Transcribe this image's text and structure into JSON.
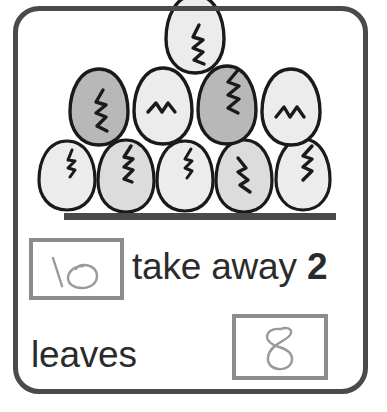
{
  "worksheet": {
    "type": "subtraction-picture-problem",
    "frame_color": "#4a4a4a",
    "background_color": "#ffffff"
  },
  "illustration": {
    "subject": "cracked-eggs",
    "total_eggs": 10,
    "outline_color": "#1a1a1a",
    "light_fill": "#ececec",
    "mid_fill": "#dcdcdc",
    "dark_fill": "#b8b8b8",
    "rows": [
      {
        "row": "top",
        "count": 1,
        "eggs": [
          {
            "shade": "light"
          }
        ]
      },
      {
        "row": "middle",
        "count": 4,
        "eggs": [
          {
            "shade": "dark"
          },
          {
            "shade": "light"
          },
          {
            "shade": "dark"
          },
          {
            "shade": "light"
          }
        ]
      },
      {
        "row": "bottom",
        "count": 5,
        "eggs": [
          {
            "shade": "light"
          },
          {
            "shade": "mid"
          },
          {
            "shade": "light"
          },
          {
            "shade": "mid"
          },
          {
            "shade": "light"
          }
        ]
      }
    ]
  },
  "separator": {
    "color": "#4a4a4a"
  },
  "problem": {
    "first_box": {
      "label": "minuend-answer-box",
      "handwritten_value": "10",
      "border_color": "#8c8c8c",
      "ink_color": "#9a9a9a"
    },
    "operator_text": "take away ",
    "subtrahend": "2",
    "result_text": "leaves",
    "second_box": {
      "label": "difference-answer-box",
      "handwritten_value": "8",
      "border_color": "#8c8c8c",
      "ink_color": "#9a9a9a"
    },
    "text_color": "#2b2b2b"
  }
}
